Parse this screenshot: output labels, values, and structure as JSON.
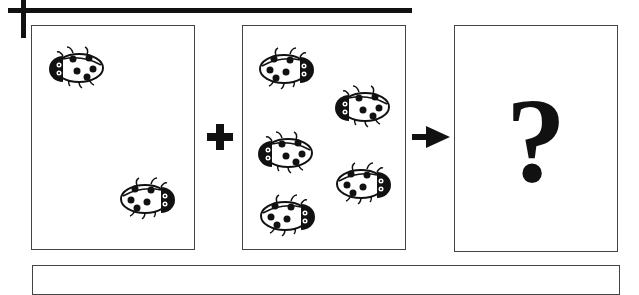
{
  "diagram": {
    "type": "ladybug addition problem",
    "panels": [
      {
        "name": "first-group",
        "ladybug_count": 2
      },
      {
        "name": "second-group",
        "ladybug_count": 5
      },
      {
        "name": "result",
        "label": "?"
      }
    ],
    "operators": {
      "plus": "+",
      "arrow": "→"
    },
    "answer_box": {
      "value": ""
    },
    "colors": {
      "ink": "#111111",
      "border": "#444444",
      "background": "#ffffff"
    }
  }
}
